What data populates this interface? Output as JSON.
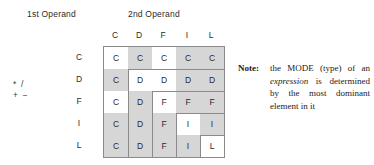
{
  "captions": {
    "first_operand": "1st Operand",
    "second_operand": "2nd Operand"
  },
  "operators": {
    "line1": "* /",
    "line2": "+ −"
  },
  "chart_data": {
    "type": "table",
    "xlabel": "2nd Operand",
    "ylabel": "1st Operand",
    "categories": [
      "C",
      "D",
      "F",
      "I",
      "L"
    ],
    "col_headers": [
      "C",
      "D",
      "F",
      "I",
      "L"
    ],
    "row_headers": [
      "C",
      "D",
      "F",
      "I",
      "L"
    ],
    "rows": [
      {
        "label": "C",
        "cells": [
          {
            "value": "C",
            "shaded": false
          },
          {
            "value": "C",
            "shaded": true
          },
          {
            "value": "C",
            "shaded": false
          },
          {
            "value": "C",
            "shaded": true
          },
          {
            "value": "C",
            "shaded": true
          }
        ]
      },
      {
        "label": "D",
        "cells": [
          {
            "value": "C",
            "shaded": true
          },
          {
            "value": "D",
            "shaded": false
          },
          {
            "value": "D",
            "shaded": false
          },
          {
            "value": "D",
            "shaded": true
          },
          {
            "value": "D",
            "shaded": true
          }
        ]
      },
      {
        "label": "F",
        "cells": [
          {
            "value": "C",
            "shaded": false
          },
          {
            "value": "D",
            "shaded": true
          },
          {
            "value": "F",
            "shaded": false
          },
          {
            "value": "F",
            "shaded": true
          },
          {
            "value": "F",
            "shaded": true
          }
        ]
      },
      {
        "label": "I",
        "cells": [
          {
            "value": "C",
            "shaded": true
          },
          {
            "value": "D",
            "shaded": true
          },
          {
            "value": "F",
            "shaded": true
          },
          {
            "value": "I",
            "shaded": false
          },
          {
            "value": "I",
            "shaded": true
          }
        ]
      },
      {
        "label": "L",
        "cells": [
          {
            "value": "C",
            "shaded": true
          },
          {
            "value": "D",
            "shaded": true
          },
          {
            "value": "F",
            "shaded": true
          },
          {
            "value": "I",
            "shaded": true
          },
          {
            "value": "L",
            "shaded": false
          }
        ]
      }
    ],
    "legend": [],
    "grid": true,
    "colors": {
      "shaded_cell": "#d6d6d6",
      "plain_cell": "#ffffff",
      "border": "#8a8a8a",
      "text": "#2b2b2b",
      "background": "#ffffff"
    }
  },
  "note": {
    "label": "Note:",
    "text_before": "the MODE (type) of an ",
    "emphasis": "expression",
    "text_after": " is determined by the most dominant element in it",
    "full_text": "Note: the MODE (type) of an expression is determined by the most dominant element in it"
  }
}
